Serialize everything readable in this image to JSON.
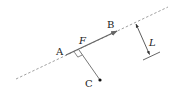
{
  "diagram": {
    "labels": {
      "A": "A",
      "B": "B",
      "F": "F",
      "C": "C",
      "L": "L"
    },
    "colors": {
      "line": "#555555",
      "dashed": "#888888",
      "point": "#111111"
    },
    "elements": [
      {
        "name": "dashed-line",
        "from": [
          16,
          79
        ],
        "to": [
          168,
          7
        ]
      },
      {
        "name": "vector-AB",
        "from": [
          66,
          55
        ],
        "to": [
          117,
          31
        ]
      },
      {
        "name": "perpendicular-CF",
        "from": [
          100,
          80
        ],
        "to": [
          79,
          50
        ]
      },
      {
        "name": "dimension-L",
        "from": [
          136,
          23
        ],
        "to": [
          150,
          55
        ]
      }
    ]
  }
}
